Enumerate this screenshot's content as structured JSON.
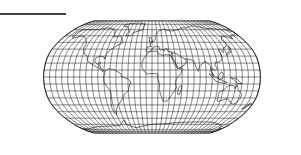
{
  "map": {
    "projection": "Robinson",
    "graticule_step_degrees": 10,
    "colors": {
      "land_fill": "#ffffff",
      "stroke": "#111111",
      "background": "#ffffff"
    },
    "continents": [
      "North America",
      "South America",
      "Europe",
      "Africa",
      "Asia",
      "Australia",
      "Antarctica",
      "Greenland"
    ]
  },
  "decor": {
    "top_rule": {
      "x1": 0,
      "x2": 66,
      "y": 14
    }
  },
  "layout": {
    "cx": 152,
    "cy": 77,
    "scale": 41.5
  }
}
